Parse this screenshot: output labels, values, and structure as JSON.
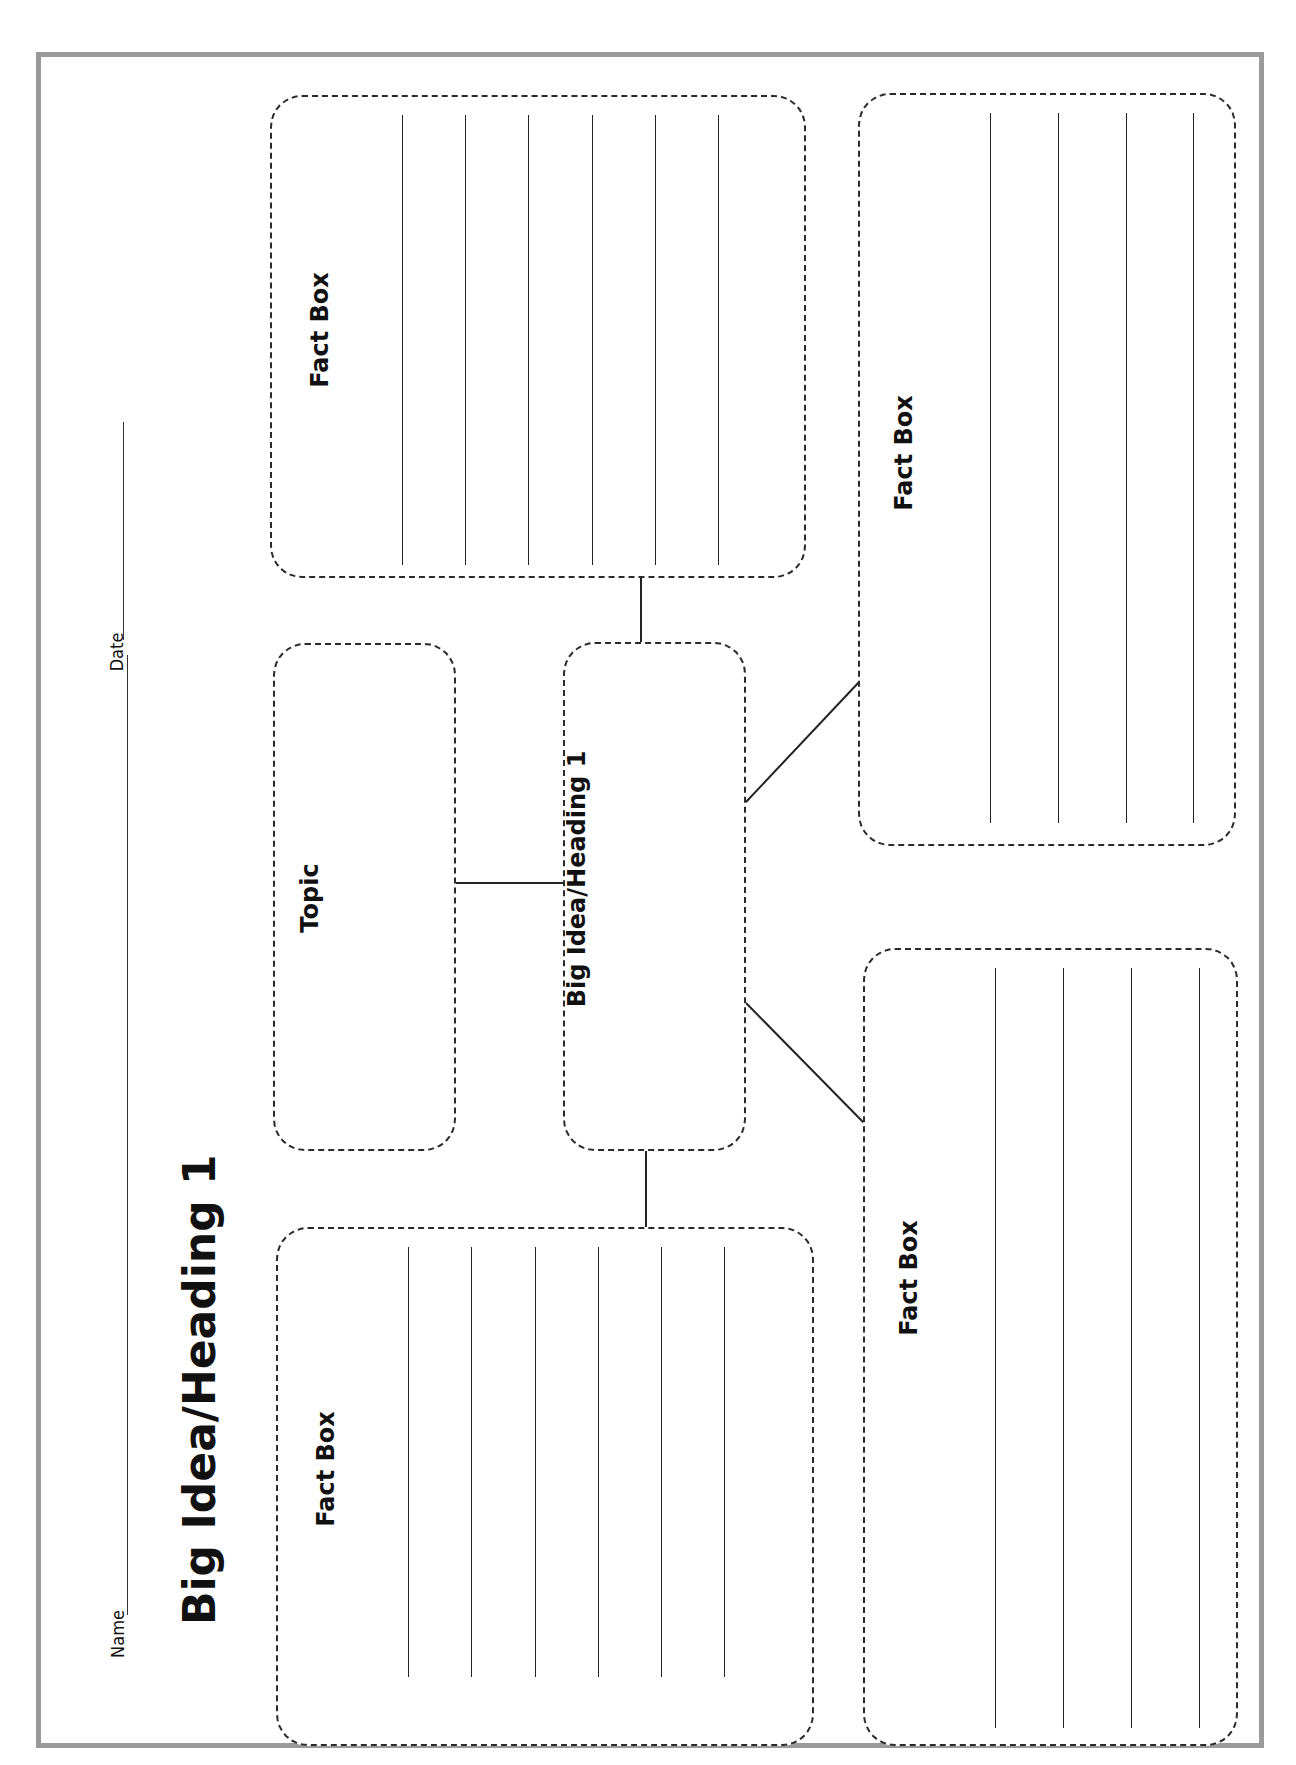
{
  "worksheet": {
    "title": "Big Idea/Heading 1",
    "name_label": "Name",
    "date_label": "Date",
    "name_value": "",
    "date_value": ""
  },
  "boxes": {
    "topic": {
      "label": "Topic",
      "value": ""
    },
    "big_idea": {
      "label": "Big Idea/Heading 1",
      "value": ""
    },
    "fact_boxes": [
      {
        "position": "top-left",
        "label": "Fact Box",
        "lines": 6
      },
      {
        "position": "top-right",
        "label": "Fact Box",
        "lines": 4
      },
      {
        "position": "bottom-right",
        "label": "Fact Box",
        "lines": 4
      },
      {
        "position": "bottom-left",
        "label": "Fact Box",
        "lines": 6
      }
    ]
  },
  "colors": {
    "ink": "#222222",
    "border_dark": "#1a1a1a",
    "border_light": "#9a9a9a",
    "paper": "#ffffff"
  }
}
